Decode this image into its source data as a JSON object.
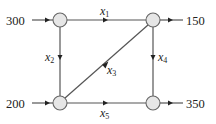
{
  "diagram": {
    "type": "network-flow",
    "nodes": [
      {
        "id": "A",
        "position": "top-left",
        "cx": 60,
        "cy": 20,
        "r": 7
      },
      {
        "id": "B",
        "position": "top-right",
        "cx": 153,
        "cy": 20,
        "r": 7
      },
      {
        "id": "C",
        "position": "bottom-left",
        "cx": 60,
        "cy": 103,
        "r": 7
      },
      {
        "id": "D",
        "position": "bottom-right",
        "cx": 153,
        "cy": 103,
        "r": 7
      }
    ],
    "external_flows": {
      "in_top_left": {
        "value": "300",
        "direction": "in",
        "node": "A"
      },
      "out_top_right": {
        "value": "150",
        "direction": "out",
        "node": "B"
      },
      "in_bottom_left": {
        "value": "200",
        "direction": "in",
        "node": "C"
      },
      "out_bottom_right": {
        "value": "350",
        "direction": "out",
        "node": "D"
      }
    },
    "edges": {
      "x1": {
        "var": "x",
        "sub": "1",
        "from": "A",
        "to": "B",
        "direction": "right"
      },
      "x2": {
        "var": "x",
        "sub": "2",
        "from": "A",
        "to": "C",
        "direction": "down"
      },
      "x3": {
        "var": "x",
        "sub": "3",
        "from": "C",
        "to": "B",
        "direction": "up-right"
      },
      "x4": {
        "var": "x",
        "sub": "4",
        "from": "B",
        "to": "D",
        "direction": "down"
      },
      "x5": {
        "var": "x",
        "sub": "5",
        "from": "C",
        "to": "D",
        "direction": "right"
      }
    },
    "colors": {
      "node_fill": "#e6e6e6",
      "node_stroke": "#666666",
      "line": "#555555",
      "arrow": "#222222",
      "text": "#222222"
    }
  }
}
